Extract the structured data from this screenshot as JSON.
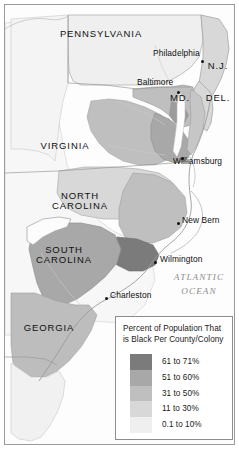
{
  "figure": {
    "kind": "thematic-choropleth-map",
    "region": "United States Atlantic seaboard colonies"
  },
  "map": {
    "states": [
      {
        "name": "PENNSYLVANIA",
        "display": "PENNSYLVANIA",
        "x": 86,
        "y": 25,
        "size": "normal"
      },
      {
        "name": "N.J.",
        "display": "N.J.",
        "x": 204,
        "y": 60,
        "size": "normal"
      },
      {
        "name": "MD.",
        "display": "MD.",
        "x": 172,
        "y": 92,
        "size": "normal"
      },
      {
        "name": "DEL.",
        "display": "DEL.",
        "x": 209,
        "y": 92,
        "size": "normal"
      },
      {
        "name": "VIRGINIA",
        "display": "VIRGINIA",
        "x": 60,
        "y": 140,
        "size": "normal"
      },
      {
        "name": "NORTH CAROLINA",
        "display": "NORTH\nCAROLINA",
        "x": 74,
        "y": 192,
        "size": "normal"
      },
      {
        "name": "SOUTH CAROLINA",
        "display": "SOUTH\nCAROLINA",
        "x": 59,
        "y": 246,
        "size": "normal"
      },
      {
        "name": "GEORGIA",
        "display": "GEORGIA",
        "x": 34,
        "y": 323,
        "size": "normal"
      }
    ],
    "cities": [
      {
        "name": "Philadelphia",
        "label": "Philadelphia",
        "dot_x": 197,
        "dot_y": 56,
        "label_x": 152,
        "label_y": 47
      },
      {
        "name": "Baltimore",
        "label": "Baltimore",
        "dot_x": 172,
        "dot_y": 87,
        "label_x": 136,
        "label_y": 76
      },
      {
        "name": "Williamsburg",
        "label": "Williamsburg",
        "dot_x": 179,
        "dot_y": 155,
        "label_x": 174,
        "label_y": 155
      },
      {
        "name": "New Bern",
        "label": "New Bern",
        "dot_x": 174,
        "dot_y": 218,
        "label_x": 178,
        "label_y": 213
      },
      {
        "name": "Wilmington",
        "label": "Wilmington",
        "dot_x": 151,
        "dot_y": 257,
        "label_x": 156,
        "label_y": 252
      },
      {
        "name": "Charleston",
        "label": "Charleston",
        "dot_x": 102,
        "dot_y": 293,
        "label_x": 105,
        "label_y": 288
      }
    ],
    "ocean_label": "ATLANTIC\nOCEAN",
    "ocean_label_x": 196,
    "ocean_label_y": 274
  },
  "legend": {
    "title": "Percent of Population That\nis Black Per County/Colony",
    "entries": [
      {
        "label": "61 to 71%",
        "color": "#7b7b7b"
      },
      {
        "label": "51 to 60%",
        "color": "#a8a8a8"
      },
      {
        "label": "31 to 50%",
        "color": "#bfbfbf"
      },
      {
        "label": "11 to 30%",
        "color": "#d8d8d8"
      },
      {
        "label": "0.1 to 10%",
        "color": "#efefef"
      }
    ]
  },
  "chart_data": {
    "type": "heatmap",
    "title": "Percent of Population That is Black Per County/Colony",
    "legend_position": "bottom-right",
    "classes": [
      {
        "range": "61 to 71%",
        "min": 61,
        "max": 71,
        "color": "#7b7b7b"
      },
      {
        "range": "51 to 60%",
        "min": 51,
        "max": 60,
        "color": "#a8a8a8"
      },
      {
        "range": "31 to 50%",
        "min": 31,
        "max": 50,
        "color": "#bfbfbf"
      },
      {
        "range": "11 to 30%",
        "min": 11,
        "max": 30,
        "color": "#d8d8d8"
      },
      {
        "range": "0.1 to 10%",
        "min": 0.1,
        "max": 10,
        "color": "#efefef"
      }
    ],
    "regions": [
      {
        "name": "PENNSYLVANIA",
        "class": "0.1 to 10%"
      },
      {
        "name": "N.J.",
        "class": "11 to 30%"
      },
      {
        "name": "DEL.",
        "class": "11 to 30%"
      },
      {
        "name": "MD.",
        "class": "31 to 50%"
      },
      {
        "name": "VIRGINIA",
        "class": "31 to 50%"
      },
      {
        "name": "Virginia Tidewater",
        "class": "51 to 60%"
      },
      {
        "name": "NORTH CAROLINA",
        "class": "11 to 30%"
      },
      {
        "name": "North Carolina coastal plain",
        "class": "31 to 50%"
      },
      {
        "name": "Cape Fear region",
        "class": "61 to 71%"
      },
      {
        "name": "SOUTH CAROLINA",
        "class": "51 to 60%"
      },
      {
        "name": "South Carolina low country",
        "class": "61 to 71%"
      },
      {
        "name": "GEORGIA",
        "class": "31 to 50%"
      }
    ]
  }
}
